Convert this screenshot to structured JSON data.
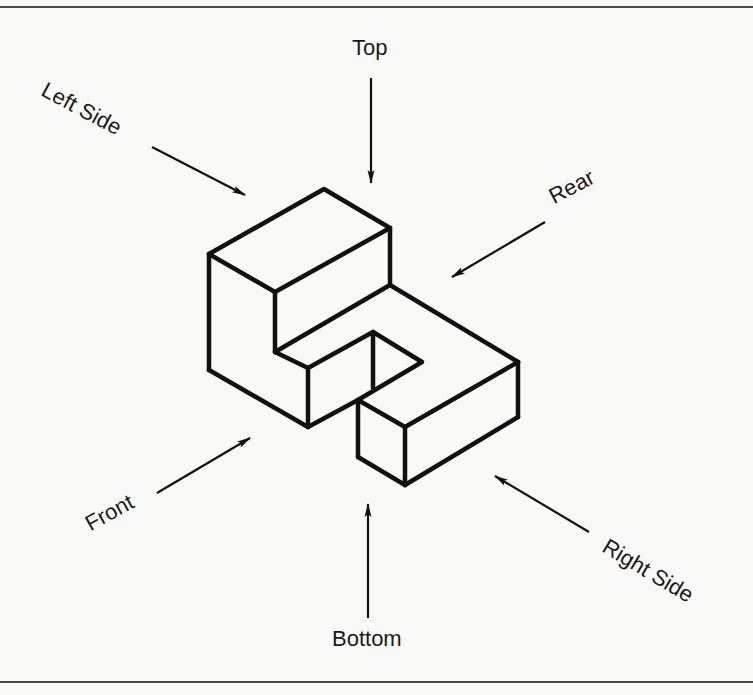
{
  "diagram": {
    "type": "isometric-view-directions",
    "colors": {
      "ink": "#111111",
      "background": "#f9f9f7",
      "rule": "#4a4a4a"
    },
    "labels": {
      "top": "Top",
      "left_side": "Left Side",
      "rear": "Rear",
      "front": "Front",
      "right_side": "Right Side",
      "bottom": "Bottom"
    },
    "object": {
      "description": "Isometric block: tall L-shaped block with step and notch, plus lower right slab"
    }
  }
}
